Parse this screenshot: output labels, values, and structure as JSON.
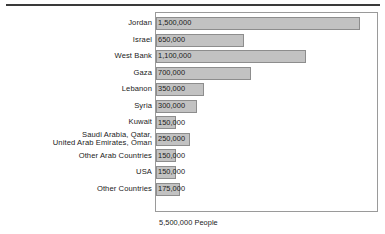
{
  "figure": {
    "caption": "5,500,000 People",
    "total_people": 5500000,
    "rule_color": "#3a3a3a",
    "bar_fill_color": "#c2c2c2",
    "bar_border_color": "#8d8d8d",
    "plot_border_color": "#9a9a9a"
  },
  "chart_data": {
    "type": "bar",
    "orientation": "horizontal",
    "title": "",
    "subtitle": "",
    "xlabel": "",
    "ylabel": "",
    "xlim": [
      0,
      1500000
    ],
    "grid": false,
    "legend": null,
    "annotations": [
      "5,500,000 People"
    ],
    "value_labels_inside_bars": true,
    "categories": [
      "Jordan",
      "Israel",
      "West Bank",
      "Gaza",
      "Lebanon",
      "Syria",
      "Kuwait",
      "Saudi Arabia, Qatar,\nUnited Arab Emirates, Oman",
      "Other Arab Countries",
      "USA",
      "Other Countries"
    ],
    "values": [
      1500000,
      650000,
      1100000,
      700000,
      350000,
      300000,
      150000,
      250000,
      150000,
      150000,
      175000
    ],
    "value_labels": [
      "1,500,000",
      "650,000",
      "1,100,000",
      "700,000",
      "350,000",
      "300,000",
      "150,000",
      "250,000",
      "150,000",
      "150,000",
      "175,000"
    ]
  }
}
